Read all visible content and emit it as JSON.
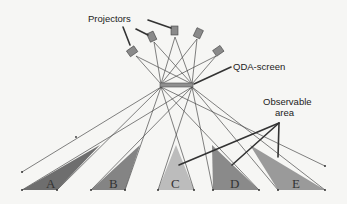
{
  "labels": {
    "projectors": "Projectors",
    "screen": "QDA-screen",
    "observable_line1": "Observable",
    "observable_line2": "area"
  },
  "areas": [
    {
      "id": "A",
      "label": "A",
      "color": "#6e6e6e"
    },
    {
      "id": "B",
      "label": "B",
      "color": "#848484"
    },
    {
      "id": "C",
      "label": "C",
      "color": "#bcbcbc"
    },
    {
      "id": "D",
      "label": "D",
      "color": "#8a8a8a"
    },
    {
      "id": "E",
      "label": "E",
      "color": "#9a9a9a"
    }
  ],
  "colors": {
    "background": "#f6f6f4",
    "ray": "#444444",
    "projector_body": "#8a8a8a",
    "screen": "#8f8f8f",
    "pointer": "#333333"
  }
}
